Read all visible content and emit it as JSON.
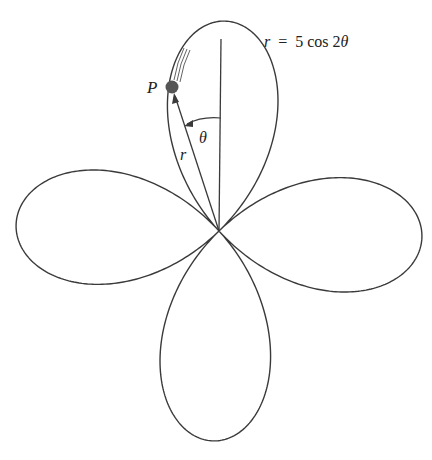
{
  "figure": {
    "equation": {
      "lhs": "r",
      "eq": "=",
      "rhs": "5 cos 2",
      "theta": "θ",
      "full": "r = 5 cos 2θ"
    },
    "labels": {
      "point": "P",
      "angle": "θ",
      "radius": "r"
    },
    "curve": {
      "type": "rose",
      "a": 5,
      "k": 2,
      "petals": 4
    },
    "colors": {
      "stroke": "#3a3a3a",
      "point": "#555555",
      "background": "#ffffff"
    }
  }
}
